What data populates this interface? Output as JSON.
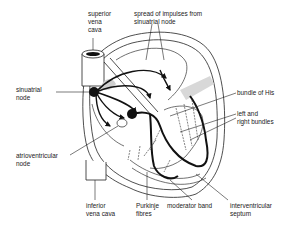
{
  "diagram": {
    "labels": {
      "superior_vena_cava": "superior\nvena\ncava",
      "spread_of_impulses": "spread of impulses from\nsinuatrial node",
      "sinuatrial_node": "sinuatrial\nnode",
      "bundle_of_his": "bundle of His",
      "left_right_bundles": "left and\nright bundles",
      "atrioventricular_node": "atrioventricular\nnode",
      "inferior_vena_cava": "inferior\nvena cava",
      "purkinje_fibres": "Purkinje\nfibres",
      "moderator_band": "moderator band",
      "interventricular_septum": "interventricular\nseptum"
    },
    "colors": {
      "ink": "#111111",
      "label": "#222222",
      "shade": "#cfcfcf",
      "background": "#ffffff"
    }
  }
}
